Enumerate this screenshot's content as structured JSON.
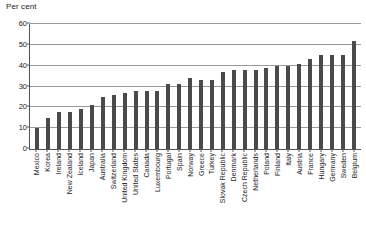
{
  "chart_data": {
    "type": "bar",
    "title": "",
    "subtitle": "",
    "xlabel": "",
    "ylabel": "Per cent",
    "ylim": [
      0,
      60
    ],
    "yticks": [
      0,
      10,
      20,
      30,
      40,
      50,
      60
    ],
    "ytick_labels": [
      "0",
      "10",
      "20",
      "30",
      "40",
      "50",
      "60"
    ],
    "grid": true,
    "legend": false,
    "bar_color": "#4a4a4a",
    "gridline_color": "#9a9a9a",
    "axis_color": "#555555",
    "background_color": "#ffffff",
    "categories": [
      "Mexico",
      "Korea",
      "Ireland",
      "New Zealand",
      "Iceland",
      "Japan",
      "Australia",
      "Switzerland",
      "United Kingdom",
      "United States",
      "Canada",
      "Luxembourg",
      "Portugal",
      "Spain",
      "Norway",
      "Greece",
      "Turkey",
      "Slovak Republic",
      "Denmark",
      "Czech Republic",
      "Netherlands",
      "Poland",
      "Finland",
      "Italy",
      "Austria",
      "France",
      "Hungary",
      "Germany",
      "Sweden",
      "Belgium"
    ],
    "values": [
      10,
      15,
      18,
      18,
      19,
      21,
      25,
      26,
      27,
      28,
      28,
      28,
      31,
      31,
      34,
      33,
      33,
      37,
      38,
      38,
      38,
      39,
      40,
      40,
      41,
      43,
      45,
      45,
      45,
      52
    ]
  },
  "axis": {
    "unit_label": "Per cent"
  }
}
